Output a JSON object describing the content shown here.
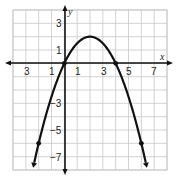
{
  "chart_data": {
    "type": "line",
    "title": "",
    "xlabel": "x",
    "ylabel": "y",
    "xlim": [
      -4,
      8
    ],
    "ylim": [
      -8,
      4
    ],
    "grid": true,
    "x_tick_labels": [
      "3",
      "1",
      "1",
      "3",
      "5",
      "7"
    ],
    "x_tick_values": [
      -3,
      -1,
      1,
      3,
      5,
      7
    ],
    "y_tick_labels": [
      "3",
      "1",
      "-3",
      "-5",
      "-7"
    ],
    "y_tick_values": [
      3,
      1,
      -3,
      -5,
      -7
    ],
    "series": [
      {
        "name": "parabola",
        "equation": "y = -0.5x^2 + 2x",
        "vertex": [
          2,
          2
        ],
        "marked_points": [
          [
            -2,
            -6
          ],
          [
            0,
            0
          ],
          [
            4,
            0
          ],
          [
            6,
            -6
          ]
        ],
        "x": [
          -2.47,
          -2,
          -1,
          0,
          1,
          2,
          3,
          4,
          5,
          6,
          6.47
        ],
        "y": [
          -8,
          -6,
          -2.5,
          0,
          1.5,
          2,
          1.5,
          0,
          -2.5,
          -6,
          -8
        ],
        "arrows_at_ends": true
      }
    ]
  },
  "labels": {
    "x_axis": "x",
    "y_axis": "y",
    "xt": [
      "3",
      "1",
      "1",
      "3",
      "5",
      "7"
    ],
    "yt": [
      "3",
      "1",
      "−3",
      "−5",
      "−7"
    ]
  }
}
